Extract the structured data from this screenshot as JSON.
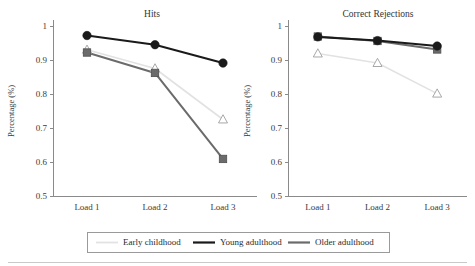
{
  "figure": {
    "y_axis_label": "Percentage (%)",
    "background_color": "#ffffff"
  },
  "panels": [
    {
      "id": "hits",
      "title": "Hits"
    },
    {
      "id": "correct-rejections",
      "title": "Correct Rejections"
    }
  ],
  "legend": {
    "items": [
      {
        "label": "Early childhood",
        "color": "#e2e2e2",
        "marker": "triangle-open"
      },
      {
        "label": "Young adulthood",
        "color": "#1a1a1a",
        "marker": "circle-filled"
      },
      {
        "label": "Older adulthood",
        "color": "#6b6b6b",
        "marker": "square-filled"
      }
    ]
  },
  "axis": {
    "y_ticks": [
      "0.5",
      "0.6",
      "0.7",
      "0.8",
      "0.9",
      "1"
    ],
    "y_values": [
      0.5,
      0.6,
      0.7,
      0.8,
      0.9,
      1.0
    ],
    "x_ticks": [
      "Load 1",
      "Load 2",
      "Load 3"
    ],
    "ylim": [
      0.5,
      1.0
    ]
  },
  "chart_data": {
    "type": "line",
    "xlabel": "",
    "ylabel": "Percentage (%)",
    "ylim": [
      0.5,
      1.0
    ],
    "grid": false,
    "legend_position": "bottom",
    "categories": [
      "Load 1",
      "Load 2",
      "Load 3"
    ],
    "panels": [
      {
        "title": "Hits",
        "series": [
          {
            "name": "Early childhood",
            "color": "#e2e2e2",
            "marker": "triangle-open",
            "values": [
              0.93,
              0.875,
              0.725
            ]
          },
          {
            "name": "Young adulthood",
            "color": "#1a1a1a",
            "marker": "circle-filled",
            "values": [
              0.972,
              0.945,
              0.891
            ]
          },
          {
            "name": "Older adulthood",
            "color": "#6b6b6b",
            "marker": "square-filled",
            "values": [
              0.922,
              0.862,
              0.609
            ]
          }
        ]
      },
      {
        "title": "Correct Rejections",
        "series": [
          {
            "name": "Early childhood",
            "color": "#e2e2e2",
            "marker": "triangle-open",
            "values": [
              0.919,
              0.891,
              0.801
            ]
          },
          {
            "name": "Young adulthood",
            "color": "#1a1a1a",
            "marker": "circle-filled",
            "values": [
              0.968,
              0.957,
              0.941
            ]
          },
          {
            "name": "Older adulthood",
            "color": "#6b6b6b",
            "marker": "square-filled",
            "values": [
              0.969,
              0.956,
              0.931
            ]
          }
        ]
      }
    ]
  }
}
